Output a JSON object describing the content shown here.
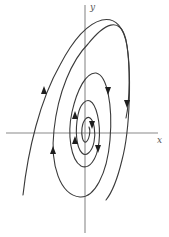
{
  "figure": {
    "type": "phase-portrait",
    "axes": {
      "x_label": "x",
      "y_label": "y"
    },
    "trajectory": {
      "direction": "clockwise, spiraling outward",
      "arrows": 8
    },
    "colors": {
      "background": "#ffffff",
      "axis": "#8a8a8a",
      "trajectory": "#3a3a3a"
    }
  }
}
